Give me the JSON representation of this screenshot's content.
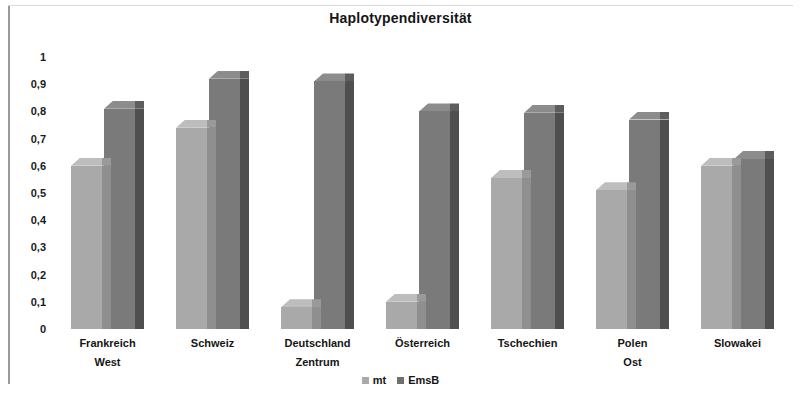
{
  "chart_data": {
    "type": "bar",
    "title": "Haplotypendiversität",
    "xlabel": "",
    "ylabel": "",
    "ylim": [
      0,
      1
    ],
    "ytick_labels": [
      "1",
      "0,9",
      "0,8",
      "0,7",
      "0,6",
      "0,5",
      "0,4",
      "0,3",
      "0,2",
      "0,1",
      "0"
    ],
    "ytick_values": [
      1,
      0.9,
      0.8,
      0.7,
      0.6,
      0.5,
      0.4,
      0.3,
      0.2,
      0.1,
      0
    ],
    "grid": false,
    "legend_position": "bottom",
    "categories": [
      "Frankreich West",
      "Schweiz",
      "Deutschland Zentrum",
      "Österreich",
      "Tschechien",
      "Polen Ost",
      "Slowakei"
    ],
    "category_lines": [
      [
        "Frankreich",
        "West"
      ],
      [
        "Schweiz",
        ""
      ],
      [
        "Deutschland",
        "Zentrum"
      ],
      [
        "Österreich",
        ""
      ],
      [
        "Tschechien",
        ""
      ],
      [
        "Polen",
        "Ost"
      ],
      [
        "Slowakei",
        ""
      ]
    ],
    "series": [
      {
        "name": "mt",
        "color": "#a9a9a9",
        "values": [
          0.6,
          0.74,
          0.08,
          0.1,
          0.555,
          0.51,
          0.6
        ]
      },
      {
        "name": "EmsB",
        "color": "#7a7a7a",
        "values": [
          0.81,
          0.92,
          0.91,
          0.8,
          0.795,
          0.77,
          0.625
        ]
      }
    ]
  },
  "legend": [
    {
      "label": "mt"
    },
    {
      "label": "EmsB"
    }
  ],
  "colors": {
    "mt": "#a9a9a9",
    "emsb": "#7a7a7a",
    "text": "#151515",
    "background": "#ffffff"
  }
}
